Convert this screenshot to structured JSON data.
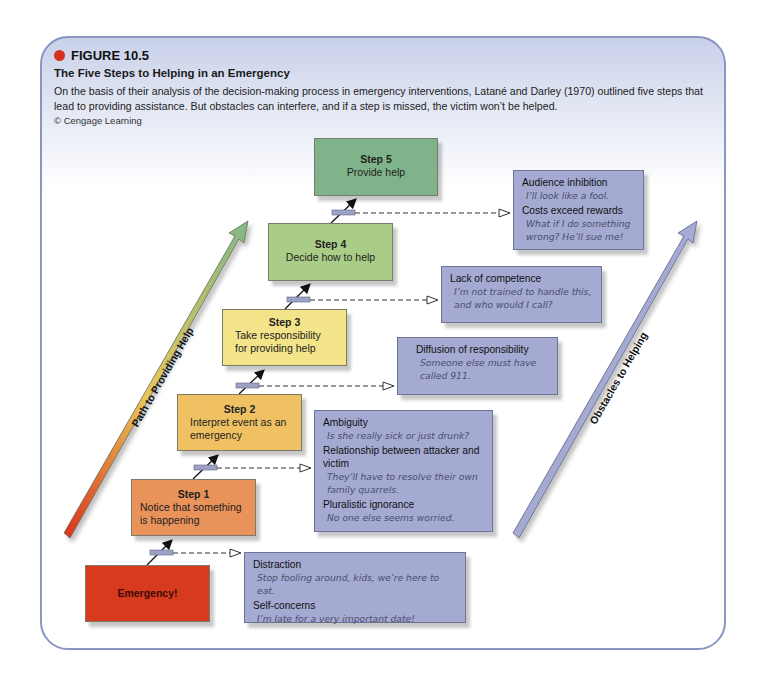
{
  "figure": {
    "label": "FIGURE 10.5",
    "title": "The Five Steps to Helping in an Emergency",
    "caption": "On the basis of their analysis of the decision-making process in emergency interventions, Latané and Darley (1970) outlined five steps that lead to providing assistance. But obstacles can interfere, and if a step is missed, the victim won’t be helped.",
    "credit": "© Cengage Learning",
    "accent_color": "#d5311c",
    "frame_color": "#8a95c4"
  },
  "arrows": {
    "path_label": "Path to Providing Help",
    "obstacles_label": "Obstacles to Helping",
    "path_gradient": [
      "#d9321c",
      "#e9c85a",
      "#7fb884"
    ],
    "obstacles_color": "#a4aad1"
  },
  "steps": [
    {
      "step": "",
      "label": "Emergency!",
      "color": "#d83a1e"
    },
    {
      "step": "Step 1",
      "label": "Notice that something is happening",
      "color": "#e9925a"
    },
    {
      "step": "Step 2",
      "label": "Interpret event as an emergency",
      "color": "#efc163"
    },
    {
      "step": "Step 3",
      "label": "Take responsibility for providing help",
      "color": "#f3e48a"
    },
    {
      "step": "Step 4",
      "label": "Decide how to help",
      "color": "#a9cd86"
    },
    {
      "step": "Step 5",
      "label": "Provide help",
      "color": "#7fb38a"
    }
  ],
  "obstacles": [
    {
      "items": [
        {
          "heading": "Distraction",
          "quote": "Stop fooling around, kids, we’re here to eat."
        },
        {
          "heading": "Self-concerns",
          "quote": "I’m late for a very important date!"
        }
      ]
    },
    {
      "items": [
        {
          "heading": "Ambiguity",
          "quote": "Is she really sick or just drunk?"
        },
        {
          "heading": "Relationship between attacker and victim",
          "quote": "They’ll have to resolve their own family quarrels."
        },
        {
          "heading": "Pluralistic ignorance",
          "quote": "No one else seems worried."
        }
      ]
    },
    {
      "items": [
        {
          "heading": "Diffusion of responsibility",
          "quote": "Someone else must have called 911."
        }
      ]
    },
    {
      "items": [
        {
          "heading": "Lack of competence",
          "quote": "I’m not trained to handle this, and who would I call?"
        }
      ]
    },
    {
      "items": [
        {
          "heading": "Audience inhibition",
          "quote": "I’ll look like a fool."
        },
        {
          "heading": "Costs exceed rewards",
          "quote": "What if I do something wrong? He’ll sue me!"
        }
      ]
    }
  ]
}
